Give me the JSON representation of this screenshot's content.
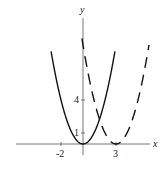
{
  "chart_data": {
    "type": "line",
    "title": "",
    "xlabel": "x",
    "ylabel": "y",
    "x_ticks": [
      {
        "value": -2,
        "label": "-2"
      },
      {
        "value": 3,
        "label": "3"
      }
    ],
    "y_ticks": [
      {
        "value": 1,
        "label": "1"
      },
      {
        "value": 4,
        "label": "4"
      }
    ],
    "xlim": [
      -4.5,
      6.5
    ],
    "ylim": [
      -0.5,
      10
    ],
    "grid": false,
    "legend": null,
    "series": [
      {
        "name": "y = x^2",
        "style": "solid",
        "color": "#111111",
        "function": "x^2",
        "x_range": [
          -2.9,
          2.9
        ]
      },
      {
        "name": "y = (x-3)^2",
        "style": "dashed",
        "color": "#111111",
        "function": "(x-3)^2",
        "x_range": [
          -0.1,
          6.0
        ]
      }
    ]
  },
  "axes": {
    "x_label": "x",
    "y_label": "y"
  },
  "ticks": {
    "x_neg2": "-2",
    "x_3": "3",
    "y_1": "1",
    "y_4": "4"
  }
}
